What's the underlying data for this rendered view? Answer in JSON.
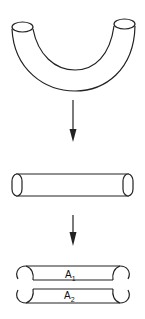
{
  "diagram": {
    "stages": [
      {
        "id": "bent-tube",
        "description": "U-shaped curved tube"
      },
      {
        "id": "straight-tube",
        "description": "Straightened cylindrical tube"
      },
      {
        "id": "split-tube",
        "description": "Tube split into two halves",
        "labels": [
          {
            "base": "A",
            "sub": "1"
          },
          {
            "base": "A",
            "sub": "2"
          }
        ]
      }
    ],
    "arrows": [
      {
        "from": "bent-tube",
        "to": "straight-tube"
      },
      {
        "from": "straight-tube",
        "to": "split-tube"
      }
    ],
    "colors": {
      "line": "#222222",
      "background": "#ffffff"
    }
  }
}
